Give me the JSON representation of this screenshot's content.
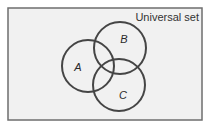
{
  "diagram": {
    "type": "venn",
    "universe": {
      "label": "Universal set",
      "x": 8,
      "y": 8,
      "width": 194,
      "height": 112,
      "fill": "#f1f1f1",
      "stroke": "#6e6e6e"
    },
    "sets": [
      {
        "name": "A",
        "label": "A",
        "cx": 88,
        "cy": 66,
        "r": 26,
        "label_x": 78,
        "label_y": 71
      },
      {
        "name": "B",
        "label": "B",
        "cx": 120,
        "cy": 48,
        "r": 26,
        "label_x": 124,
        "label_y": 43
      },
      {
        "name": "C",
        "label": "C",
        "cx": 119,
        "cy": 85,
        "r": 26,
        "label_x": 123,
        "label_y": 99
      }
    ],
    "circle_stroke": "#454545"
  }
}
